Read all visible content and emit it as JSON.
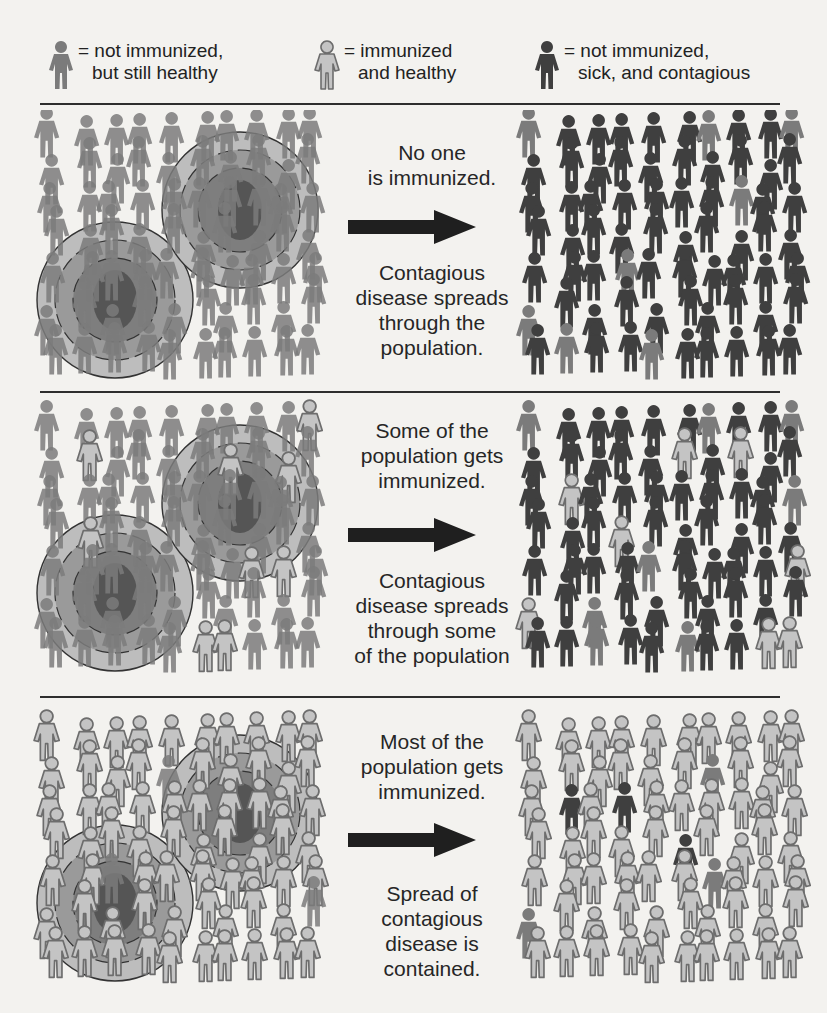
{
  "legend": {
    "items": [
      {
        "type": "not_immunized_healthy",
        "line1": "= not immunized,",
        "line2": "but still healthy"
      },
      {
        "type": "immunized_healthy",
        "line1": "= immunized",
        "line2": "and healthy"
      },
      {
        "type": "not_immunized_sick",
        "line1": "= not immunized,",
        "line2": "sick, and contagious"
      }
    ]
  },
  "colors": {
    "background": "#f3f2ef",
    "not_immunized_healthy": "#7b7b7b",
    "immunized_healthy_fill": "#c4c4c4",
    "immunized_healthy_stroke": "#6d6d6d",
    "not_immunized_sick": "#3f3f3f",
    "ring_outer": "#bdbdbd",
    "ring_middle": "#9a9a9a",
    "ring_inner": "#7e7e7e",
    "ring_core": "#555555",
    "separator": "#2e2e2e",
    "arrow": "#1f1f1f"
  },
  "rows": [
    {
      "scenario": "No one is immunized",
      "caption_top": [
        "No one",
        "is immunized."
      ],
      "caption_bottom": [
        "Contagious",
        "disease spreads",
        "through the",
        "population."
      ],
      "left_types": "NNNNNNNNNNNNNNNNNNNNNNNNNNNNNNNNNNNNNNNNNNNNNNNNNNNNNNN",
      "right_types": "NSSSSSNSSNSSSSSSSSSSSSSSSSSNSSSSSSSSSSSSSSSNSSSSSSSSSSS"
    },
    {
      "scenario": "Some of the population gets immunized",
      "caption_top": [
        "Some of the",
        "population gets",
        "immunized."
      ],
      "caption_bottom": [
        "Contagious",
        "disease spreads",
        "through some",
        "of the population"
      ],
      "left_types": "NNNNNNNNNIINNNNNNNIINNNNNNNNNNNNNNNINNNNNNNNNNNIINNNNNNN",
      "right_types": "NSSSSSNSSNSSIISSSSSSSISSSSSSSNSSSSSSISSSSSSSNSSSSISSSSSI"
    },
    {
      "scenario": "Most of the population gets immunized",
      "caption_top": [
        "Most of the",
        "population gets",
        "immunized."
      ],
      "caption_bottom": [
        "Spread of",
        "contagious",
        "disease is",
        "contained."
      ],
      "left_types": "IIIIIIIIIIIIIIIIINIIIIIIIIIIIIIIIIIIIIIIIINIIIIIIIIIIINI",
      "right_types": "IIIIIIIIIIIIIIIIIINIISISIIIIIIIIIIIIISIIIIIIIINIIIIIIIIN"
    }
  ]
}
